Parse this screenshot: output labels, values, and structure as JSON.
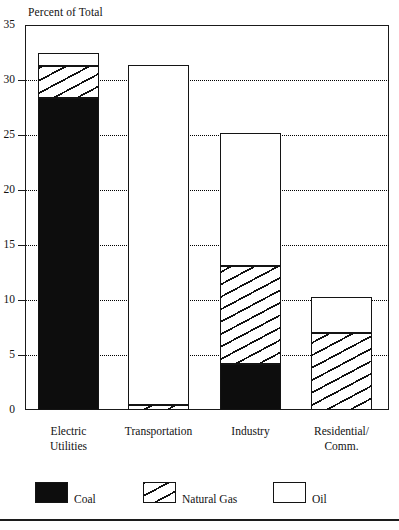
{
  "figure": {
    "axis_caption": "Percent of Total",
    "bottom_rule": true
  },
  "chart_data": {
    "type": "bar",
    "subtype": "stacked-vertical",
    "title": "",
    "subtitle": "",
    "xlabel": "",
    "ylabel": "Percent of Total",
    "ylim": [
      0,
      35
    ],
    "ytick_step": 5,
    "yticks": [
      0,
      5,
      10,
      15,
      20,
      25,
      30,
      35
    ],
    "ytick_labels": [
      "0",
      "5",
      "10",
      "15",
      "20",
      "25",
      "30",
      "35"
    ],
    "grid": "horizontal-dotted",
    "legend_position": "bottom",
    "categories": [
      "Electric Utilities",
      "Transportation",
      "Industry",
      "Residential/ Comm."
    ],
    "category_label_lines": [
      [
        "Electric",
        "Utilities"
      ],
      [
        "Transportation"
      ],
      [
        "Industry"
      ],
      [
        "Residential/",
        "Comm."
      ]
    ],
    "series": [
      {
        "name": "Coal",
        "pattern": "solid-black",
        "color": "#0d0d0d",
        "values": [
          28.4,
          0.0,
          4.2,
          0.0
        ]
      },
      {
        "name": "Natural Gas",
        "pattern": "diagonal-hatch",
        "color": "#ffffff",
        "values": [
          2.9,
          0.5,
          8.9,
          7.0
        ]
      },
      {
        "name": "Oil",
        "pattern": "empty-white",
        "color": "#ffffff",
        "values": [
          1.2,
          30.9,
          12.1,
          3.3
        ]
      }
    ],
    "totals": [
      32.5,
      31.4,
      25.2,
      10.3
    ],
    "stack_order_bottom_to_top": [
      "Coal",
      "Natural Gas",
      "Oil"
    ]
  },
  "legend": {
    "items": [
      {
        "label": "Coal",
        "swatch": "solid-black"
      },
      {
        "label": "Natural Gas",
        "swatch": "diagonal-hatch"
      },
      {
        "label": "Oil",
        "swatch": "empty-white"
      }
    ]
  }
}
